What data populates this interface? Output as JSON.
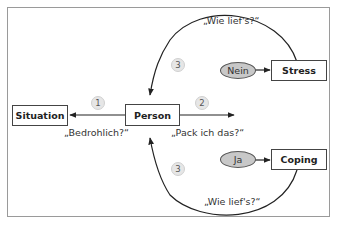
{
  "nodes": {
    "situation": "Situation",
    "person": "Person",
    "stress": "Stress",
    "coping": "Coping"
  },
  "decisions": {
    "nein": "Nein",
    "ja": "Ja"
  },
  "steps": {
    "step1": "1",
    "step2": "2",
    "step3_top": "3",
    "step3_bottom": "3"
  },
  "questions": {
    "bedrohlich": "„Bedrohlich?“",
    "pack_ich_das": "„Pack ich das?“",
    "wie_liefs_top": "„Wie lief's?“",
    "wie_liefs_bottom": "„Wie lief's?“"
  },
  "colors": {
    "ellipse_fill": "#c8c8c8",
    "badge_fill": "#e6e6e6",
    "stroke": "#222222",
    "frame": "#9a9a9a"
  }
}
